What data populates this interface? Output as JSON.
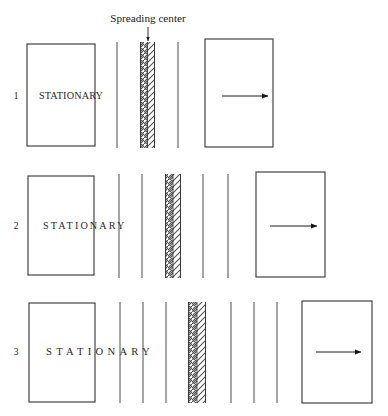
{
  "figure": {
    "title_annotation": "Spreading center",
    "background_color": "#ffffff",
    "ink_color": "#1a1a1a",
    "rows": [
      {
        "number": "1",
        "stationary_label": "STATIONARY",
        "left_plate": {
          "x": 27,
          "y": 44,
          "w": 68,
          "h": 102
        },
        "right_plate": {
          "x": 205,
          "y": 39,
          "w": 68,
          "h": 108
        },
        "spreading_band": {
          "x": 140,
          "y": 42,
          "w": 15,
          "h": 106
        },
        "isochron_lines_left": [
          117
        ],
        "isochron_lines_right": [
          178
        ],
        "line_top": 42,
        "line_bottom": 148,
        "arrow": {
          "x1": 222,
          "x2": 268,
          "y": 96
        },
        "label_y": 99,
        "number_x": 16,
        "label_x": 39
      },
      {
        "number": "2",
        "stationary_label": "STATIONARY",
        "left_plate": {
          "x": 28,
          "y": 176,
          "w": 66,
          "h": 99
        },
        "right_plate": {
          "x": 256,
          "y": 172,
          "w": 69,
          "h": 105
        },
        "spreading_band": {
          "x": 165,
          "y": 174,
          "w": 16,
          "h": 104
        },
        "isochron_lines_left": [
          119,
          142
        ],
        "isochron_lines_right": [
          203,
          228
        ],
        "line_top": 174,
        "line_bottom": 278,
        "arrow": {
          "x1": 270,
          "x2": 317,
          "y": 226
        },
        "label_y": 229,
        "number_x": 16,
        "label_x": 43
      },
      {
        "number": "3",
        "stationary_label": "STATIONARY",
        "left_plate": {
          "x": 29,
          "y": 303,
          "w": 66,
          "h": 99
        },
        "right_plate": {
          "x": 302,
          "y": 301,
          "w": 70,
          "h": 102
        },
        "spreading_band": {
          "x": 188,
          "y": 302,
          "w": 18,
          "h": 101
        },
        "isochron_lines_left": [
          120,
          143,
          166
        ],
        "isochron_lines_right": [
          231,
          254,
          277
        ],
        "line_top": 302,
        "line_bottom": 403,
        "arrow": {
          "x1": 316,
          "x2": 361,
          "y": 352
        },
        "label_y": 355,
        "number_x": 16,
        "label_x": 46
      }
    ],
    "pointer": {
      "x": 148,
      "y_top": 28,
      "y_bottom": 42
    },
    "annotation_text_pos": {
      "x": 148,
      "y": 22
    }
  }
}
